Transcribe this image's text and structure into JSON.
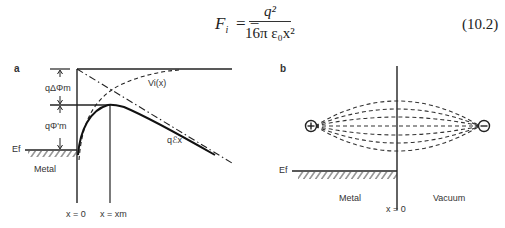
{
  "equation": {
    "lhs": "F",
    "lhs_sub": "i",
    "sign": "= −",
    "numerator": "q²",
    "denominator": "16π ε₀x²",
    "number": "(10.2)"
  },
  "panel_a": {
    "label": "a",
    "delta_phi_label": "qΔΦm",
    "phi_prime_label": "qΦ'm",
    "vi_label": "Vi(x)",
    "field_label": "qℰx",
    "ef_label": "Ef",
    "metal_label": "Metal",
    "x0_label": "x = 0",
    "xm_label": "x = xm"
  },
  "panel_b": {
    "label": "b",
    "ef_label": "Ef",
    "metal_label": "Metal",
    "vacuum_label": "Vacuum",
    "x0_label": "x = 0",
    "positive_charge": "+",
    "negative_charge": "−"
  },
  "colors": {
    "ink": "#222222",
    "background": "#ffffff"
  }
}
